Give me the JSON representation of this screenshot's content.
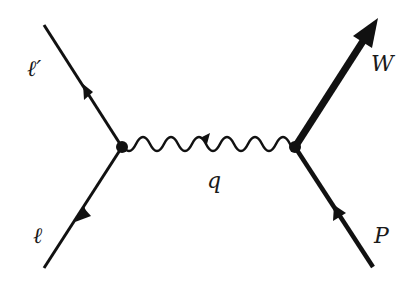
{
  "diagram": {
    "type": "feynman",
    "labels": {
      "lepton_out": "ℓ′",
      "lepton_in": "ℓ",
      "photon": "q",
      "boson_out": "W",
      "hadron_in": "P"
    },
    "colors": {
      "line": "#111111",
      "background": "#ffffff"
    }
  }
}
